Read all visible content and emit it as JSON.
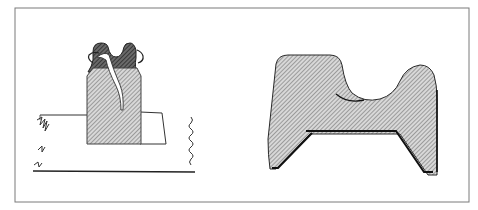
{
  "plate": {
    "background": "#ffffff",
    "frame_color": "#6a6a6a",
    "ink_color": "#1a1a1a",
    "hatch_light": "#9a9a9a",
    "hatch_dark": "#3a3a3a"
  },
  "figures": [
    {
      "id": "left",
      "subject": "block-on-ruled-sheet",
      "labels": []
    },
    {
      "id": "right",
      "subject": "profile-cross-section",
      "labels": []
    }
  ]
}
